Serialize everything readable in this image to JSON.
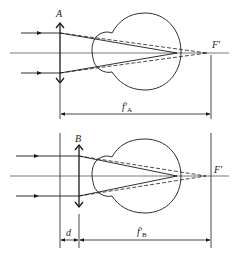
{
  "diagram": {
    "title": "",
    "colors": {
      "ink": "#1a1a1a",
      "axis": "#555555",
      "background": "#ffffff"
    },
    "panels": [
      {
        "id": "A",
        "lens_label": "A",
        "focus_label": "F′",
        "dimension_label_main": "f′",
        "dimension_label_sub": "A",
        "description": "Converging lens A placed directly at the eye; parallel rays focus at F′ behind the eye (dashed), solid rays converge at retina."
      },
      {
        "id": "B",
        "lens_label": "B",
        "focus_label": "F′",
        "distance_label": "d",
        "dimension_label_main": "f′",
        "dimension_label_sub": "B",
        "description": "Converging lens B placed at distance d in front of the reference plane; focal length f′B measured from lens to F′."
      }
    ]
  }
}
